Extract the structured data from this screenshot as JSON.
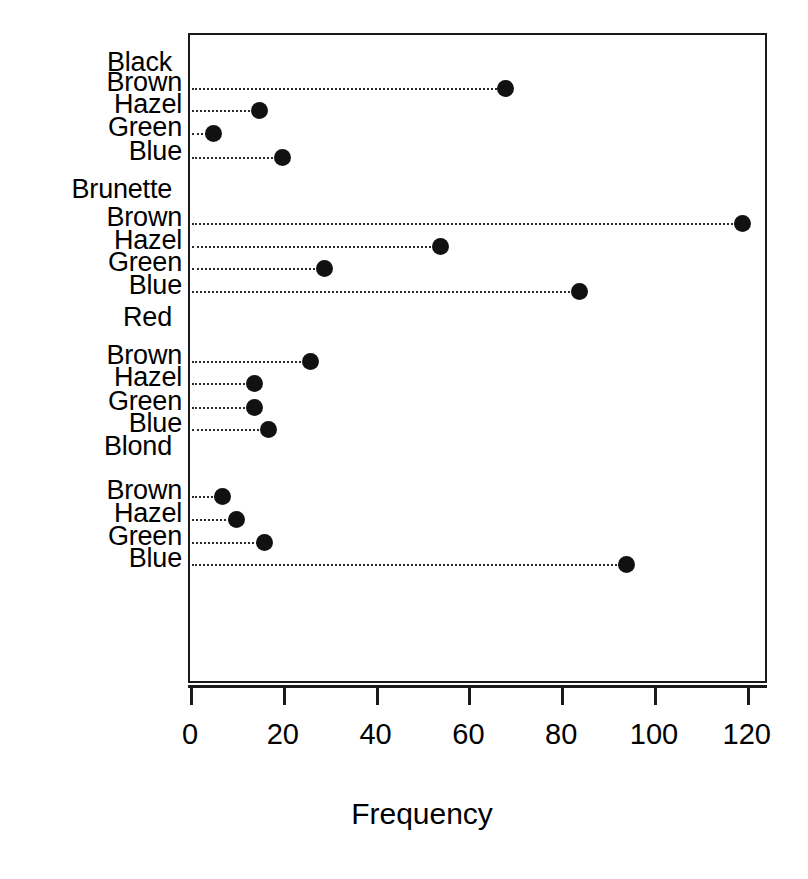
{
  "chart_data": {
    "type": "scatter",
    "subtype": "cleveland-dot-plot",
    "title": "",
    "xlabel": "Frequency",
    "ylabel": "",
    "xlim": [
      0,
      125
    ],
    "xticks": [
      0,
      20,
      40,
      60,
      80,
      100,
      120
    ],
    "xtick_labels": [
      "0",
      "20",
      "40",
      "60",
      "80",
      "100",
      "120"
    ],
    "grid": false,
    "legend": null,
    "dot_color": "#111111",
    "leader_line_style": "dotted",
    "frame": true,
    "groups": [
      {
        "label": "Black",
        "rows": [
          {
            "label": "Brown",
            "value": 68
          },
          {
            "label": "Hazel",
            "value": 15
          },
          {
            "label": "Green",
            "value": 5
          },
          {
            "label": "Blue",
            "value": 20
          }
        ]
      },
      {
        "label": "Brunette",
        "rows": [
          {
            "label": "Brown",
            "value": 119
          },
          {
            "label": "Hazel",
            "value": 54
          },
          {
            "label": "Green",
            "value": 29
          },
          {
            "label": "Blue",
            "value": 84
          }
        ]
      },
      {
        "label": "Red",
        "rows": [
          {
            "label": "Brown",
            "value": 26
          },
          {
            "label": "Hazel",
            "value": 14
          },
          {
            "label": "Green",
            "value": 14
          },
          {
            "label": "Blue",
            "value": 17
          }
        ]
      },
      {
        "label": "Blond",
        "rows": [
          {
            "label": "Brown",
            "value": 7
          },
          {
            "label": "Hazel",
            "value": 10
          },
          {
            "label": "Green",
            "value": 16
          },
          {
            "label": "Blue",
            "value": 94
          }
        ]
      }
    ]
  },
  "geometry": {
    "plot_left": 190,
    "plot_right": 766,
    "plot_top": 33,
    "plot_bottom": 683,
    "x_zero_px": 190,
    "px_per_unit": 4.64,
    "group_label_y": [
      63,
      190,
      318,
      447
    ],
    "row_y": [
      [
        88,
        110,
        133,
        157
      ],
      [
        223,
        246,
        268,
        291
      ],
      [
        361,
        383,
        407,
        429
      ],
      [
        496,
        519,
        542,
        564
      ]
    ],
    "label_y_offset": -5
  }
}
